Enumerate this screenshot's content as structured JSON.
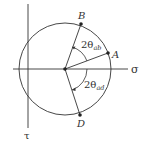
{
  "diagram": {
    "axes": {
      "horizontal_label": "σ",
      "vertical_label": "τ"
    },
    "points": {
      "center": "C",
      "a": "A",
      "b": "B",
      "d": "D"
    },
    "angles": {
      "ab": {
        "prefix": "2θ",
        "subscript": "ab"
      },
      "ad": {
        "prefix": "2θ",
        "subscript": "ad"
      }
    },
    "colors": {
      "stroke": "#333333",
      "background": "#ffffff"
    }
  }
}
